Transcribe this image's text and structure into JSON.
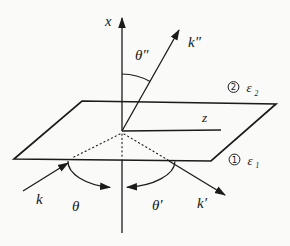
{
  "figure": {
    "colors": {
      "ink": "#1b1b1b",
      "paper": "#fafaf8"
    },
    "axis_labels": {
      "x": "x",
      "z": "z"
    },
    "wave_vectors": {
      "incident": "k",
      "reflected": "k′",
      "refracted": "k″"
    },
    "angle_labels": {
      "incidence": "θ",
      "reflection": "θ′",
      "refraction": "θ″"
    },
    "media": {
      "upper": {
        "number": "2",
        "symbol": "ε",
        "subscript": "2"
      },
      "lower": {
        "number": "1",
        "symbol": "ε",
        "subscript": "1"
      }
    }
  }
}
